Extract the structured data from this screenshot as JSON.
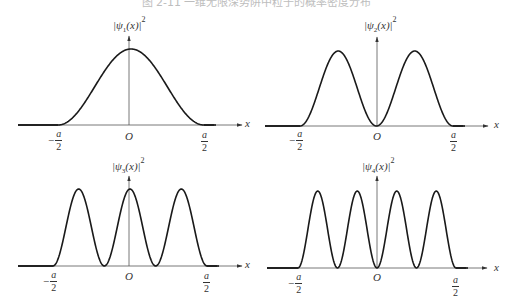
{
  "caption": "图 2-11 一维无限深势阱中粒子的概率密度分布",
  "plots": [
    {
      "id": "psi1",
      "ylabel_main": "|ψ",
      "ylabel_sub": "1",
      "ylabel_tail": "(x)|",
      "ylabel_sup": "2",
      "xlabel": "x",
      "origin": "O",
      "tick_left_num": "a",
      "tick_left_den": "2",
      "tick_left_sign": "−",
      "tick_right_num": "a",
      "tick_right_den": "2"
    },
    {
      "id": "psi2",
      "ylabel_main": "|ψ",
      "ylabel_sub": "2",
      "ylabel_tail": "(x)|",
      "ylabel_sup": "2",
      "xlabel": "x",
      "origin": "O",
      "tick_left_num": "a",
      "tick_left_den": "2",
      "tick_left_sign": "−",
      "tick_right_num": "a",
      "tick_right_den": "2"
    },
    {
      "id": "psi3",
      "ylabel_main": "|ψ",
      "ylabel_sub": "3",
      "ylabel_tail": "(x)|",
      "ylabel_sup": "2",
      "xlabel": "x",
      "origin": "O",
      "tick_left_num": "a",
      "tick_left_den": "2",
      "tick_left_sign": "−",
      "tick_right_num": "a",
      "tick_right_den": "2"
    },
    {
      "id": "psi4",
      "ylabel_main": "|ψ",
      "ylabel_sub": "4",
      "ylabel_tail": "(x)|",
      "ylabel_sup": "2",
      "xlabel": "x",
      "origin": "O",
      "tick_left_num": "a",
      "tick_left_den": "2",
      "tick_left_sign": "−",
      "tick_right_num": "a",
      "tick_right_den": "2"
    }
  ],
  "chart_data": [
    {
      "type": "line",
      "title": "|ψ1(x)|²",
      "xlabel": "x",
      "ylabel": "|ψ1(x)|²",
      "function": "sin^2(n*pi*(x/a + 1/2)), zero outside well",
      "n": 1,
      "xlim": [
        "-a/2",
        "a/2"
      ],
      "x_ticks": [
        "-a/2",
        "O",
        "a/2"
      ],
      "peaks": 1,
      "nodes_inside": 0,
      "grid": false
    },
    {
      "type": "line",
      "title": "|ψ2(x)|²",
      "xlabel": "x",
      "ylabel": "|ψ2(x)|²",
      "function": "sin^2(n*pi*(x/a + 1/2)), zero outside well",
      "n": 2,
      "xlim": [
        "-a/2",
        "a/2"
      ],
      "x_ticks": [
        "-a/2",
        "O",
        "a/2"
      ],
      "peaks": 2,
      "nodes_inside": 1,
      "grid": false
    },
    {
      "type": "line",
      "title": "|ψ3(x)|²",
      "xlabel": "x",
      "ylabel": "|ψ3(x)|²",
      "function": "sin^2(n*pi*(x/a + 1/2)), zero outside well",
      "n": 3,
      "xlim": [
        "-a/2",
        "a/2"
      ],
      "x_ticks": [
        "-a/2",
        "O",
        "a/2"
      ],
      "peaks": 3,
      "nodes_inside": 2,
      "grid": false
    },
    {
      "type": "line",
      "title": "|ψ4(x)|²",
      "xlabel": "x",
      "ylabel": "|ψ4(x)|²",
      "function": "sin^2(n*pi*(x/a + 1/2)), zero outside well",
      "n": 4,
      "xlim": [
        "-a/2",
        "a/2"
      ],
      "x_ticks": [
        "-a/2",
        "O",
        "a/2"
      ],
      "peaks": 4,
      "nodes_inside": 3,
      "grid": false
    }
  ],
  "layout": [
    {
      "lineStart": 18,
      "wellL": 58,
      "origin": 129,
      "wellR": 204,
      "arrowEnd": 242,
      "base": 125,
      "peak": 49,
      "axisTop": 36
    },
    {
      "lineStart": 265,
      "wellL": 300,
      "origin": 377,
      "wellR": 453,
      "arrowEnd": 488,
      "base": 126,
      "peak": 51,
      "axisTop": 37
    },
    {
      "lineStart": 18,
      "wellL": 53,
      "origin": 129,
      "wellR": 207,
      "arrowEnd": 242,
      "base": 266,
      "peak": 189,
      "axisTop": 176
    },
    {
      "lineStart": 267,
      "wellL": 298,
      "origin": 377,
      "wellR": 456,
      "arrowEnd": 487,
      "base": 268,
      "peak": 191,
      "axisTop": 176
    }
  ],
  "colors": {
    "curve": "#1a1a1a",
    "axis": "#555555",
    "background": "#ffffff"
  }
}
